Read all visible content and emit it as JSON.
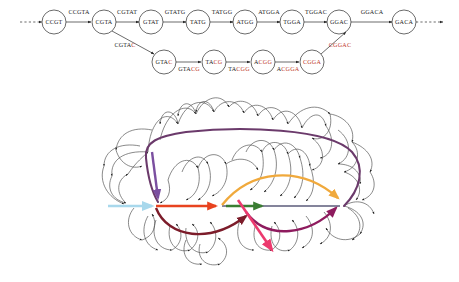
{
  "figure": {
    "panels": [
      {
        "id": "top",
        "name": "kmer-bubble-graph"
      },
      {
        "id": "bottom",
        "name": "tangled-graph-with-colored-paths"
      }
    ]
  },
  "top_graph": {
    "description": "Directed k-mer graph with a reference path and an alternate (mutated) bubble path",
    "main_path_nodes": [
      {
        "id": "n0",
        "label": "CCGT",
        "x": 54,
        "y": 22,
        "mut_from": 4
      },
      {
        "id": "n1",
        "label": "CGTA",
        "x": 104,
        "y": 22,
        "mut_from": 4
      },
      {
        "id": "n2",
        "label": "GTAT",
        "x": 151,
        "y": 22,
        "mut_from": 4
      },
      {
        "id": "n3",
        "label": "TATG",
        "x": 198,
        "y": 22,
        "mut_from": 4
      },
      {
        "id": "n4",
        "label": "ATGG",
        "x": 245,
        "y": 22,
        "mut_from": 4
      },
      {
        "id": "n5",
        "label": "TGGA",
        "x": 292,
        "y": 22,
        "mut_from": 4
      },
      {
        "id": "n6",
        "label": "GGAC",
        "x": 339,
        "y": 22,
        "mut_from": 4
      },
      {
        "id": "n7",
        "label": "GACA",
        "x": 404,
        "y": 22,
        "mut_from": 4
      }
    ],
    "bubble_path_nodes": [
      {
        "id": "b0",
        "label": "GTAC",
        "x": 164,
        "y": 62,
        "mut_from": 3
      },
      {
        "id": "b1",
        "label": "TACG",
        "x": 214,
        "y": 62,
        "mut_from": 2
      },
      {
        "id": "b2",
        "label": "ACGG",
        "x": 263,
        "y": 62,
        "mut_from": 1
      },
      {
        "id": "b3",
        "label": "CGGA",
        "x": 312,
        "y": 62,
        "mut_from": 0
      }
    ],
    "main_edge_labels": [
      {
        "label": "CCGTA",
        "x": 79,
        "y": 14,
        "mut_from": 5
      },
      {
        "label": "CGTAT",
        "x": 127,
        "y": 14,
        "mut_from": 5
      },
      {
        "label": "GTATG",
        "x": 175,
        "y": 14,
        "mut_from": 5
      },
      {
        "label": "TATGG",
        "x": 222,
        "y": 14,
        "mut_from": 5
      },
      {
        "label": "ATGGA",
        "x": 269,
        "y": 14,
        "mut_from": 5
      },
      {
        "label": "TGGAC",
        "x": 316,
        "y": 14,
        "mut_from": 5
      },
      {
        "label": "GGACA",
        "x": 372,
        "y": 14,
        "mut_from": 5
      }
    ],
    "bubble_edge_labels": [
      {
        "label": "CGTAC",
        "x": 125,
        "y": 47,
        "mut_from": 4
      },
      {
        "label": "GTACG",
        "x": 189,
        "y": 70,
        "mut_from": 3
      },
      {
        "label": "TACGG",
        "x": 239,
        "y": 70,
        "mut_from": 2
      },
      {
        "label": "ACGGA",
        "x": 288,
        "y": 70,
        "mut_from": 1
      },
      {
        "label": "CGGAC",
        "x": 340,
        "y": 47,
        "mut_from": 0
      }
    ],
    "terminal_markers": {
      "left": "dashed-in-arrow",
      "right": "dashed-out-arrow"
    },
    "colors": {
      "node_stroke": "#2b2b2b",
      "edge": "#2b2b2b",
      "text": "#1a1a1a",
      "mutation_text": "#c0392b"
    }
  },
  "bottom_graph": {
    "description": "Dense tangled directed graph with colored highlighted traversal paths",
    "colors": {
      "background_edges": "#4a4a4a",
      "light_blue": "#a8d8ec",
      "purple_short": "#7b4fa0",
      "orange_red": "#e8431f",
      "orange": "#f0a93c",
      "green": "#3a7d32",
      "dark_red": "#7c1c2a",
      "plum_loop": "#6b3a6b",
      "magenta": "#8e1b5e",
      "pink": "#ec3a6e",
      "slate_line": "#5b5b7a"
    },
    "colored_paths": [
      {
        "name": "light-blue-entry-arrow",
        "color": "#a8d8ec",
        "role": "entry"
      },
      {
        "name": "purple-descent-arrow",
        "color": "#7b4fa0",
        "role": "branch-in"
      },
      {
        "name": "orange-red-arrow",
        "color": "#e8431f",
        "role": "segment-1"
      },
      {
        "name": "orange-arc-arrow",
        "color": "#f0a93c",
        "role": "bubble-upper"
      },
      {
        "name": "green-arrow",
        "color": "#3a7d32",
        "role": "segment-2"
      },
      {
        "name": "dark-red-arc-arrow",
        "color": "#7c1c2a",
        "role": "bubble-lower"
      },
      {
        "name": "plum-outer-loop",
        "color": "#6b3a6b",
        "role": "long-range-loop"
      },
      {
        "name": "magenta-arrow",
        "color": "#8e1b5e",
        "role": "segment-3"
      },
      {
        "name": "pink-exit-arrow",
        "color": "#ec3a6e",
        "role": "exit"
      },
      {
        "name": "slate-horizontal-line",
        "color": "#5b5b7a",
        "role": "spine"
      }
    ]
  }
}
